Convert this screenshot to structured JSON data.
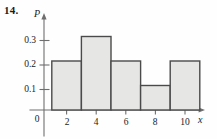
{
  "figure": {
    "problem_number": "14.",
    "y_axis_title": "P",
    "x_axis_title": "x",
    "origin_label": "0"
  },
  "chart_data": {
    "type": "bar",
    "title": "",
    "subtitle": "",
    "xlabel": "x",
    "ylabel": "P",
    "grid": false,
    "legend": false,
    "legend_position": "none",
    "bar_style": "histogram",
    "xlim": [
      0,
      11.6
    ],
    "ylim": [
      0,
      0.345
    ],
    "xticks": [
      0,
      2,
      4,
      6,
      8,
      10
    ],
    "xtick_labels": [
      "0",
      "2",
      "4",
      "6",
      "8",
      "10"
    ],
    "yticks": [
      0.1,
      0.2,
      0.3
    ],
    "ytick_labels": [
      "0.1",
      "0.2",
      "0.3"
    ],
    "bin_edges": [
      1,
      3,
      5,
      7,
      9,
      11
    ],
    "categories": [
      "1-3",
      "3-5",
      "5-7",
      "7-9",
      "9-11"
    ],
    "values": [
      0.2,
      0.3,
      0.2,
      0.1,
      0.2
    ],
    "bars": [
      {
        "x0": 1,
        "x1": 3,
        "height": 0.2
      },
      {
        "x0": 3,
        "x1": 5,
        "height": 0.3
      },
      {
        "x0": 5,
        "x1": 7,
        "height": 0.2
      },
      {
        "x0": 7,
        "x1": 9,
        "height": 0.1
      },
      {
        "x0": 9,
        "x1": 11,
        "height": 0.2
      }
    ],
    "annotations": []
  },
  "colors": {
    "bar_fill": "#e6e6e4",
    "bar_stroke": "#4a4a4a",
    "axis": "#6e6e6e",
    "text": "#1a1a1a",
    "background": "#fefefe"
  }
}
